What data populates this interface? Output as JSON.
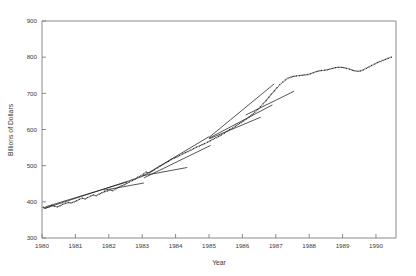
{
  "chart_data": {
    "type": "line",
    "title": "",
    "xlabel": "Year",
    "ylabel": "Billions of Dollars",
    "xlim": [
      1980,
      1990.6
    ],
    "ylim": [
      300,
      900
    ],
    "grid": false,
    "legend": "none",
    "xticks": [
      1980,
      1981,
      1982,
      1983,
      1984,
      1985,
      1986,
      1987,
      1988,
      1989,
      1990
    ],
    "xtick_labels": [
      "1980",
      "1981",
      "1982",
      "1983",
      "1984",
      "1985",
      "1986",
      "1987",
      "1988",
      "1989",
      "1990"
    ],
    "yticks": [
      300,
      400,
      500,
      600,
      700,
      800,
      900
    ],
    "ytick_labels": [
      "300",
      "400",
      "500",
      "600",
      "700",
      "800",
      "900"
    ],
    "series": [
      {
        "name": "observed",
        "style": "dotted",
        "marker": "dot",
        "x": [
          1980.04,
          1980.12,
          1980.21,
          1980.29,
          1980.37,
          1980.46,
          1980.54,
          1980.62,
          1980.71,
          1980.79,
          1980.87,
          1980.96,
          1981.04,
          1981.12,
          1981.21,
          1981.29,
          1981.37,
          1981.46,
          1981.54,
          1981.62,
          1981.71,
          1981.79,
          1981.87,
          1981.96,
          1982.04,
          1982.12,
          1982.21,
          1982.29,
          1982.37,
          1982.46,
          1982.54,
          1982.62,
          1982.71,
          1982.79,
          1982.87,
          1982.96,
          1983.04,
          1983.12,
          1983.21,
          1983.29,
          1983.37,
          1983.46,
          1983.54,
          1983.62,
          1983.71,
          1983.79,
          1983.87,
          1983.96,
          1984.04,
          1984.12,
          1984.21,
          1984.29,
          1984.37,
          1984.46,
          1984.54,
          1984.62,
          1984.71,
          1984.79,
          1984.87,
          1984.96,
          1985.04,
          1985.12,
          1985.21,
          1985.29,
          1985.37,
          1985.46,
          1985.54,
          1985.62,
          1985.71,
          1985.79,
          1985.87,
          1985.96,
          1986.04,
          1986.12,
          1986.21,
          1986.29,
          1986.37,
          1986.46,
          1986.54,
          1986.62,
          1986.71,
          1986.79,
          1986.87,
          1986.96,
          1987.04,
          1987.12,
          1987.21,
          1987.29,
          1987.37,
          1987.46,
          1987.54,
          1987.62,
          1987.71,
          1987.79,
          1987.87,
          1987.96,
          1988.04,
          1988.12,
          1988.21,
          1988.29,
          1988.37,
          1988.46,
          1988.54,
          1988.62,
          1988.71,
          1988.79,
          1988.87,
          1988.96,
          1989.04,
          1989.12,
          1989.21,
          1989.29,
          1989.37,
          1989.46,
          1989.54,
          1989.62,
          1989.71,
          1989.79,
          1989.87,
          1989.96,
          1990.04,
          1990.12,
          1990.21,
          1990.29,
          1990.37,
          1990.46
        ],
        "y": [
          385,
          383,
          386,
          390,
          388,
          386,
          389,
          393,
          396,
          398,
          397,
          400,
          403,
          407,
          410,
          408,
          412,
          416,
          419,
          417,
          421,
          425,
          428,
          430,
          433,
          431,
          436,
          440,
          444,
          447,
          451,
          455,
          459,
          463,
          468,
          472,
          477,
          482,
          480,
          484,
          489,
          494,
          499,
          503,
          508,
          512,
          517,
          521,
          524,
          528,
          532,
          536,
          539,
          543,
          547,
          551,
          554,
          558,
          561,
          565,
          569,
          573,
          577,
          581,
          585,
          590,
          595,
          600,
          604,
          609,
          614,
          619,
          624,
          629,
          635,
          641,
          648,
          655,
          663,
          671,
          680,
          689,
          698,
          707,
          716,
          724,
          731,
          737,
          742,
          745,
          747,
          748,
          749,
          750,
          751,
          752,
          754,
          757,
          760,
          762,
          763,
          764,
          765,
          767,
          769,
          771,
          772,
          772,
          771,
          769,
          767,
          764,
          762,
          761,
          762,
          765,
          769,
          773,
          777,
          781,
          785,
          788,
          791,
          794,
          797,
          800
        ]
      }
    ],
    "trend_segments": [
      {
        "name": "segment-1980-1983",
        "x": [
          1980.05,
          1983.0
        ],
        "y": [
          381,
          470
        ]
      },
      {
        "name": "segment-1980-1982b",
        "x": [
          1980.1,
          1982.55
        ],
        "y": [
          386,
          455
        ]
      },
      {
        "name": "segment-1982-1983",
        "x": [
          1981.85,
          1983.05
        ],
        "y": [
          432,
          452
        ]
      },
      {
        "name": "segment-1983-1985",
        "x": [
          1983.0,
          1985.0
        ],
        "y": [
          470,
          580
        ]
      },
      {
        "name": "segment-1983-1985b",
        "x": [
          1983.05,
          1985.05
        ],
        "y": [
          466,
          556
        ]
      },
      {
        "name": "segment-1983-1984c",
        "x": [
          1983.0,
          1984.35
        ],
        "y": [
          472,
          495
        ]
      },
      {
        "name": "segment-1985-1987",
        "x": [
          1985.0,
          1986.95
        ],
        "y": [
          578,
          726
        ]
      },
      {
        "name": "segment-1985-1987b",
        "x": [
          1985.0,
          1986.9
        ],
        "y": [
          576,
          668
        ]
      },
      {
        "name": "segment-1985-1986c",
        "x": [
          1985.0,
          1986.55
        ],
        "y": [
          574,
          634
        ]
      },
      {
        "name": "segment-1986-1987",
        "x": [
          1986.1,
          1987.55
        ],
        "y": [
          640,
          706
        ]
      }
    ]
  }
}
